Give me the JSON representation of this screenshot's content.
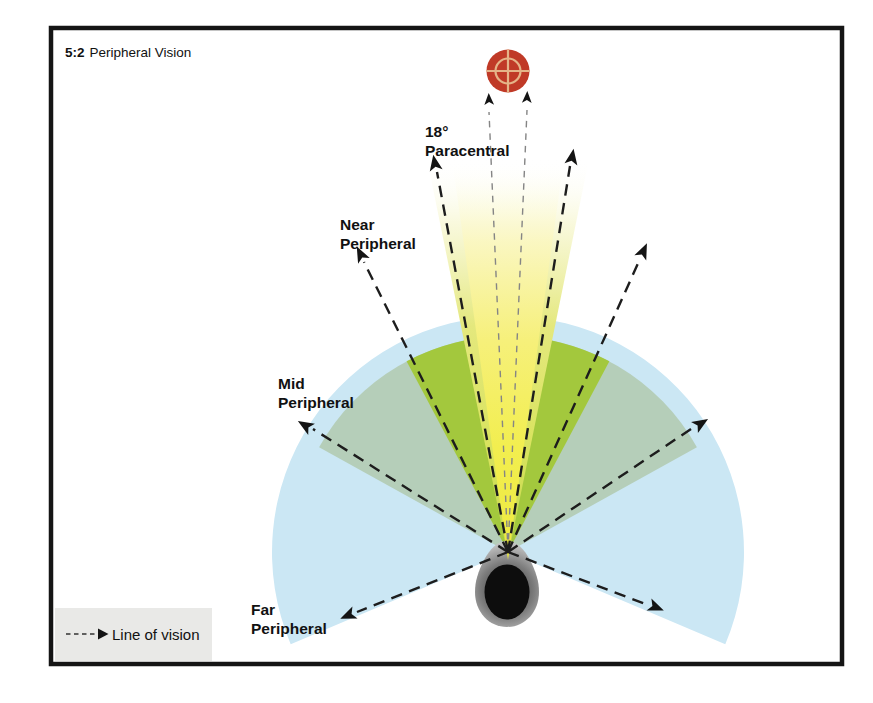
{
  "header": {
    "figure_number": "5:2",
    "figure_title": "Peripheral Vision"
  },
  "labels": {
    "paracentral": {
      "line1": "18°",
      "line2": "Paracentral"
    },
    "near": {
      "line1": "Near",
      "line2": "Peripheral"
    },
    "mid": {
      "line1": "Mid",
      "line2": "Peripheral"
    },
    "far": {
      "line1": "Far",
      "line2": "Peripheral"
    }
  },
  "legend": {
    "line_of_vision": "Line of vision"
  },
  "colors": {
    "far_peripheral": "#cbe7f4",
    "mid_peripheral": "#b5ceb9",
    "near_peripheral": "#a3c83d",
    "beam_outer": "#d9e35f",
    "beam_core": "#f2ee4f",
    "target_red": "#c03a27",
    "target_crosshair": "#e5b488",
    "line_dark": "#1d1d1d",
    "line_light": "#858585",
    "legend_bg": "#e9e9e7",
    "frame": "#151515"
  }
}
